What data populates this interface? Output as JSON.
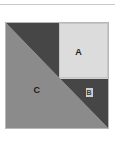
{
  "figure": {
    "regions": [
      {
        "id": "a",
        "label": "A",
        "shape": "square",
        "color": "#dcdcdc",
        "position": "upper-right"
      },
      {
        "id": "b",
        "label": "B",
        "shape": "triangle",
        "color": "#464646",
        "position": "lower-right"
      },
      {
        "id": "c",
        "label": "C",
        "shape": "triangle",
        "color": "#8b8b8b",
        "position": "lower-left"
      },
      {
        "id": "dark-upper",
        "label": "",
        "shape": "triangle",
        "color": "#464646",
        "position": "upper-left"
      }
    ],
    "outline_color": "#b8b8b8",
    "background": "#ffffff",
    "rule_color": "#c9c9c9"
  }
}
